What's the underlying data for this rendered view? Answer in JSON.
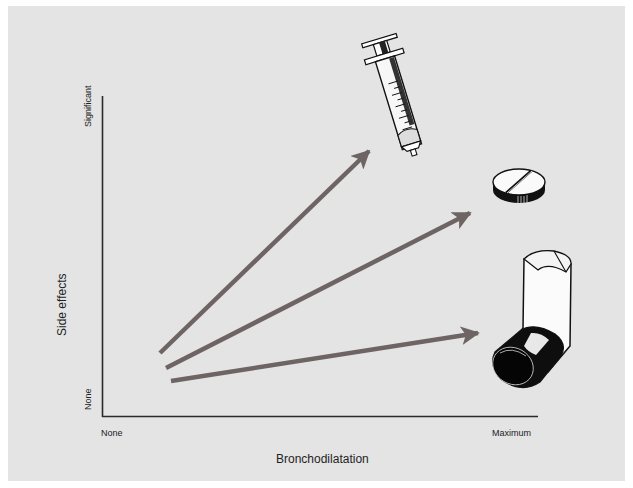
{
  "figure": {
    "x_axis": {
      "title": "Bronchodilatation",
      "min_label": "None",
      "max_label": "Maximum"
    },
    "y_axis": {
      "title": "Side effects",
      "min_label": "None",
      "max_label": "Significant"
    },
    "arrows": [
      {
        "target": "syringe",
        "meaning": "injection",
        "from": [
          160,
          353
        ],
        "to": [
          372,
          148
        ]
      },
      {
        "target": "tablet",
        "meaning": "oral tablet",
        "from": [
          166,
          368
        ],
        "to": [
          474,
          211
        ]
      },
      {
        "target": "inhaler",
        "meaning": "metered-dose inhaler",
        "from": [
          171,
          381
        ],
        "to": [
          482,
          333
        ]
      }
    ],
    "icons": [
      "syringe-icon",
      "tablet-icon",
      "inhaler-icon"
    ],
    "colors": {
      "background": "#e4e4e4",
      "axis": "#2a2a2a",
      "arrow": "#6e6464",
      "text": "#222222"
    }
  }
}
